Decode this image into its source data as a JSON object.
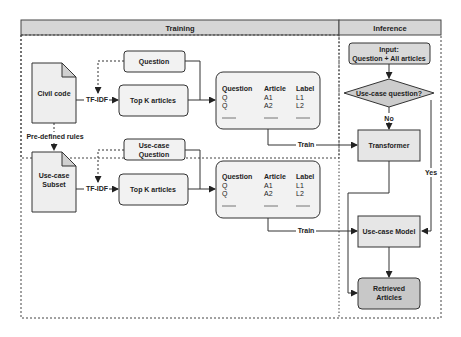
{
  "lanes": {
    "training": "Training",
    "inference": "Inference"
  },
  "training": {
    "civil_code": "Civil code",
    "predefined_rules": "Pre-defined rules",
    "use_case_subset": [
      "Use-case",
      "Subset"
    ],
    "tfidf_top": "TF-IDF",
    "tfidf_bottom": "TF-IDF",
    "question": "Question",
    "use_case_question": [
      "Use-case",
      "Question"
    ],
    "top_k_top": "Top K articles",
    "top_k_bottom": "Top K articles",
    "table_top": {
      "headers": [
        "Question",
        "Article",
        "Label"
      ],
      "rows": [
        [
          "Q",
          "A1",
          "L1"
        ],
        [
          "Q",
          "A2",
          "L2"
        ]
      ]
    },
    "table_bottom": {
      "headers": [
        "Question",
        "Article",
        "Label"
      ],
      "rows": [
        [
          "Q",
          "A1",
          "L1"
        ],
        [
          "Q",
          "A2",
          "L2"
        ]
      ]
    },
    "train_top": "Train",
    "train_bottom": "Train"
  },
  "inference": {
    "input": [
      "Input:",
      "Question + All articles"
    ],
    "decision": "Use-case question?",
    "no": "No",
    "yes": "Yes",
    "transformer": "Transformer",
    "use_case_model": "Use-case Model",
    "retrieved": [
      "Retrieved",
      "Articles"
    ]
  },
  "colors": {
    "header_fill": "#d6d6d6",
    "box_fill": "#f2f2f2",
    "doc_fill": "#eeeeee",
    "decision_fill": "#cccccc",
    "retrieved_fill": "#c8c8c8",
    "stroke": "#333333"
  }
}
